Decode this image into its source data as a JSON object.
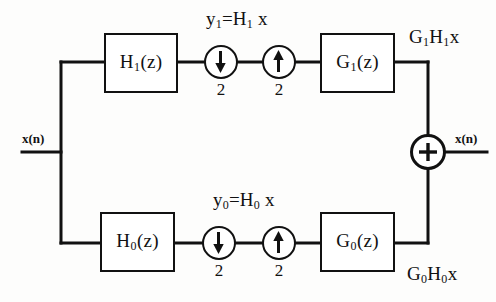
{
  "diagram": {
    "input_port_label": "x(n)",
    "output_port_label": "x(n)",
    "colors": {
      "line": "#111111",
      "background": "#fdfdfc",
      "box_fill": "#ffffff"
    },
    "upper_branch": {
      "analysis_filter": {
        "base": "H",
        "index": "1",
        "arg": "(z)"
      },
      "decimator": {
        "symbol": "down-arrow",
        "factor": "2"
      },
      "interpolator": {
        "symbol": "up-arrow",
        "factor": "2"
      },
      "synthesis_filter": {
        "base": "G",
        "index": "1",
        "arg": "(z)"
      },
      "intermediate_label": {
        "lhs_base": "y",
        "lhs_index": "1",
        "equals": "=",
        "rhs_base": "H",
        "rhs_index": "1",
        "rhs_tail": " x"
      },
      "output_label": {
        "g_base": "G",
        "g_index": "1",
        "h_base": "H",
        "h_index": "1",
        "tail": "x"
      }
    },
    "lower_branch": {
      "analysis_filter": {
        "base": "H",
        "index": "0",
        "arg": "(z)"
      },
      "decimator": {
        "symbol": "down-arrow",
        "factor": "2"
      },
      "interpolator": {
        "symbol": "up-arrow",
        "factor": "2"
      },
      "synthesis_filter": {
        "base": "G",
        "index": "0",
        "arg": "(z)"
      },
      "intermediate_label": {
        "lhs_base": "y",
        "lhs_index": "0",
        "equals": "=",
        "rhs_base": "H",
        "rhs_index": "0",
        "rhs_tail": " x"
      },
      "output_label": {
        "g_base": "G",
        "g_index": "0",
        "h_base": "H",
        "h_index": "0",
        "tail": "x"
      }
    },
    "summer": {
      "operator": "+"
    }
  }
}
